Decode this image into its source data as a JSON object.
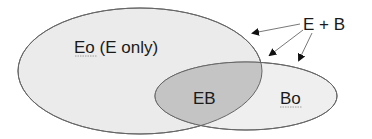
{
  "diagram": {
    "type": "venn",
    "regions": {
      "e_only": "Eo (E only)",
      "overlap": "EB",
      "b_only": "Bo"
    },
    "annotation": "E + B",
    "colors": {
      "large_ellipse_fill": "#ebebeb",
      "small_ellipse_fill": "#efefef",
      "overlap_fill": "#c4c4c4",
      "stroke": "#666666",
      "text": "#1a1a1a"
    }
  }
}
